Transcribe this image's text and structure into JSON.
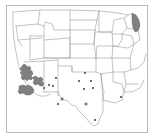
{
  "figure": {
    "type": "distribution-map",
    "region": "Western and South-Central United States",
    "background_color": "#ffffff",
    "frame_color": "#b9b9b9",
    "state_outline_color": "#9a9a9a",
    "shaded_fill_color": "#808080",
    "shaded_stroke_color": "#5a5a5a",
    "point_marker_color": "#6e6e6e",
    "caption": ""
  },
  "map_data": {
    "frame": {
      "x": 6,
      "y": 5,
      "width": 141,
      "height": 127
    },
    "shaded_areas": [
      {
        "name": "arizona-central-range",
        "label": "Central Arizona shaded range"
      },
      {
        "name": "arizona-southwest-range",
        "label": "Southwestern Arizona shaded range"
      },
      {
        "name": "arizona-southeast-range",
        "label": "Southeastern Arizona shaded range"
      },
      {
        "name": "michigan-shaded-area",
        "label": "Michigan shaded area"
      }
    ],
    "point_markers": [
      {
        "name": "marker-nm-north",
        "x": 56,
        "y": 78
      },
      {
        "name": "marker-nm-west",
        "x": 49,
        "y": 85
      },
      {
        "name": "marker-nm-central",
        "x": 53,
        "y": 86
      },
      {
        "name": "marker-az-border",
        "x": 44,
        "y": 88
      },
      {
        "name": "marker-tx-panhandle",
        "x": 85,
        "y": 73
      },
      {
        "name": "marker-tx-north",
        "x": 79,
        "y": 81
      },
      {
        "name": "marker-tx-northeast",
        "x": 91,
        "y": 81
      },
      {
        "name": "marker-tx-central-north",
        "x": 84,
        "y": 89
      },
      {
        "name": "marker-tx-central",
        "x": 93,
        "y": 88
      },
      {
        "name": "marker-tx-west",
        "x": 62,
        "y": 99
      },
      {
        "name": "marker-tx-southwest",
        "x": 58,
        "y": 104
      },
      {
        "name": "marker-tx-central-south",
        "x": 86,
        "y": 104
      },
      {
        "name": "marker-tx-south",
        "x": 95,
        "y": 120
      },
      {
        "name": "marker-la-east",
        "x": 121,
        "y": 97
      }
    ],
    "state_boundaries_visible": true,
    "graticule": false,
    "legend": null
  }
}
